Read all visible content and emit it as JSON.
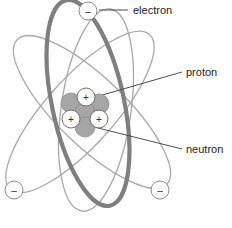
{
  "diagram": {
    "background_color": "#ffffff",
    "width": 232,
    "height": 228
  },
  "colors": {
    "orbit_thick": "#7f7f7f",
    "orbit_thin": "#a8a8a8",
    "neutron_fill": "#a6a6a6",
    "neutron_stroke": "#8f8f8f",
    "proton_fill": "#ffffff",
    "proton_stroke": "#6e6e6e",
    "electron_fill": "#ffffff",
    "electron_stroke": "#8a8a8a",
    "leader_line": "#4d4d4d",
    "text": "#1a1a1a"
  },
  "labels": [
    {
      "id": "electron",
      "text": "electron",
      "x": 133,
      "y": 14,
      "leader": {
        "x1": 99,
        "y1": 10,
        "x2": 128,
        "y2": 10
      }
    },
    {
      "id": "proton",
      "text": "proton",
      "x": 186,
      "y": 76,
      "leader": {
        "x1": 92,
        "y1": 98,
        "x2": 182,
        "y2": 72
      }
    },
    {
      "id": "neutron",
      "text": "neutron",
      "x": 186,
      "y": 153,
      "leader": {
        "x1": 90,
        "y1": 126,
        "x2": 182,
        "y2": 149
      }
    }
  ],
  "electrons": [
    {
      "id": "electron-top",
      "cx": 88,
      "cy": 11,
      "r": 9,
      "sign": "–"
    },
    {
      "id": "electron-bottom-left",
      "cx": 14,
      "cy": 190,
      "r": 9,
      "sign": "–"
    },
    {
      "id": "electron-bottom-right",
      "cx": 160,
      "cy": 190,
      "r": 9,
      "sign": "–"
    }
  ],
  "nucleus": {
    "center_x": 81,
    "center_y": 110,
    "neutrons": [
      {
        "id": "neutron-upper-left",
        "cx": 71,
        "cy": 103,
        "r": 10
      },
      {
        "id": "neutron-upper-right",
        "cx": 99,
        "cy": 104,
        "r": 10
      },
      {
        "id": "neutron-center",
        "cx": 85,
        "cy": 112,
        "r": 10
      },
      {
        "id": "neutron-bottom",
        "cx": 85,
        "cy": 127,
        "r": 10
      }
    ],
    "protons": [
      {
        "id": "proton-top",
        "cx": 86,
        "cy": 97,
        "r": 9,
        "sign": "+"
      },
      {
        "id": "proton-left",
        "cx": 71,
        "cy": 119,
        "r": 9,
        "sign": "+"
      },
      {
        "id": "proton-right",
        "cx": 99,
        "cy": 119,
        "r": 9,
        "sign": "+"
      }
    ]
  },
  "orbits": [
    {
      "id": "orbit-thick-vertical",
      "rx": 36,
      "ry": 105,
      "rotate": -12,
      "cx": 88,
      "cy": 103,
      "width": 4.2,
      "shade": "thick"
    },
    {
      "id": "orbit-thin-left",
      "rx": 34,
      "ry": 104,
      "rotate": 42,
      "cx": 80,
      "cy": 112,
      "width": 1.3,
      "shade": "thin"
    },
    {
      "id": "orbit-thin-right",
      "rx": 34,
      "ry": 104,
      "rotate": -46,
      "cx": 92,
      "cy": 112,
      "width": 1.3,
      "shade": "thin"
    },
    {
      "id": "orbit-thin-vertical",
      "rx": 35,
      "ry": 102,
      "rotate": 8,
      "cx": 96,
      "cy": 110,
      "width": 1.3,
      "shade": "thin"
    }
  ]
}
